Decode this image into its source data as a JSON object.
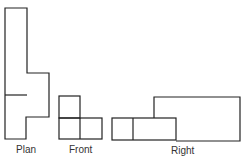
{
  "labels": {
    "plan": "Plan",
    "front": "Front",
    "right": "Right"
  },
  "colors": {
    "stroke": "#222222",
    "text": "#333333"
  }
}
